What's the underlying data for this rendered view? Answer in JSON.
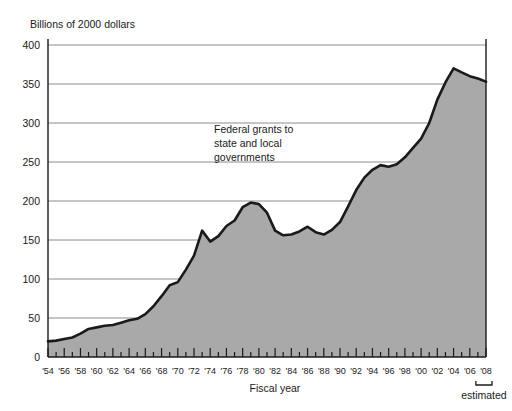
{
  "chart_data": {
    "type": "area",
    "title": "Billions of 2000 dollars",
    "xlabel": "Fiscal year",
    "ylabel": "",
    "ylim": [
      0,
      400
    ],
    "xlim": [
      1954,
      2008
    ],
    "grid": true,
    "legend": "none",
    "annotation": {
      "lines": [
        "Federal grants to",
        "state and local",
        "governments"
      ]
    },
    "estimated_note": {
      "label": "estimated",
      "range": [
        "'07",
        "'08"
      ]
    },
    "ytick_labels": [
      "0",
      "50",
      "100",
      "150",
      "200",
      "250",
      "300",
      "350",
      "400"
    ],
    "ytick_values": [
      0,
      50,
      100,
      150,
      200,
      250,
      300,
      350,
      400
    ],
    "xtick_labels": [
      "'54",
      "'56",
      "'58",
      "'60",
      "'62",
      "'64",
      "'66",
      "'68",
      "'70",
      "'72",
      "'74",
      "'76",
      "'78",
      "'80",
      "'82",
      "'84",
      "'86",
      "'88",
      "'90",
      "'92",
      "'94",
      "'96",
      "'98",
      "'00",
      "'02",
      "'04",
      "'06",
      "'08"
    ],
    "x": [
      1954,
      1955,
      1956,
      1957,
      1958,
      1959,
      1960,
      1961,
      1962,
      1963,
      1964,
      1965,
      1966,
      1967,
      1968,
      1969,
      1970,
      1971,
      1972,
      1973,
      1974,
      1975,
      1976,
      1977,
      1978,
      1979,
      1980,
      1981,
      1982,
      1983,
      1984,
      1985,
      1986,
      1987,
      1988,
      1989,
      1990,
      1991,
      1992,
      1993,
      1994,
      1995,
      1996,
      1997,
      1998,
      1999,
      2000,
      2001,
      2002,
      2003,
      2004,
      2005,
      2006,
      2007,
      2008
    ],
    "values": [
      20,
      21,
      23,
      25,
      30,
      36,
      38,
      40,
      41,
      44,
      47,
      49,
      55,
      65,
      78,
      92,
      96,
      112,
      130,
      162,
      148,
      155,
      168,
      175,
      192,
      198,
      196,
      185,
      162,
      156,
      157,
      161,
      167,
      160,
      157,
      163,
      173,
      193,
      214,
      230,
      240,
      246,
      244,
      247,
      256,
      268,
      280,
      300,
      330,
      352,
      370,
      365,
      360,
      357,
      353
    ],
    "colors": {
      "fill": "#a9a9a9",
      "line": "#1a1a1a",
      "grid": "#8c8c8c",
      "axis": "#1a1a1a",
      "background": "#ffffff"
    }
  }
}
